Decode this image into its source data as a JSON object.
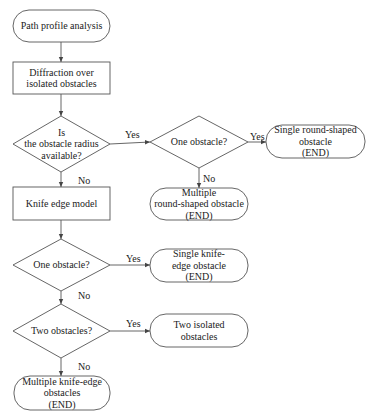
{
  "colors": {
    "stroke": "#555555",
    "text": "#222222",
    "background": "#ffffff"
  },
  "nodes": {
    "start": {
      "lines": [
        "Path profile analysis"
      ],
      "shape": "terminal"
    },
    "diffraction": {
      "lines": [
        "Diffraction over",
        "isolated obstacles"
      ],
      "shape": "process"
    },
    "radius_decision": {
      "lines": [
        "Is",
        "the obstacle radius",
        "available?"
      ],
      "shape": "decision"
    },
    "one_obstacle_round": {
      "lines": [
        "One obstacle?"
      ],
      "shape": "decision"
    },
    "single_round_end": {
      "lines": [
        "Single round-shaped",
        "obstacle",
        "(END)"
      ],
      "shape": "terminal"
    },
    "multiple_round_end": {
      "lines": [
        "Multiple",
        "round-shaped obstacle",
        "(END)"
      ],
      "shape": "terminal"
    },
    "knife_edge_model": {
      "lines": [
        "Knife edge model"
      ],
      "shape": "process"
    },
    "one_obstacle_knife": {
      "lines": [
        "One obstacle?"
      ],
      "shape": "decision"
    },
    "single_knife_end": {
      "lines": [
        "Single knife-",
        "edge obstacle",
        "(END)"
      ],
      "shape": "terminal"
    },
    "two_obstacles": {
      "lines": [
        "Two obstacles?"
      ],
      "shape": "decision"
    },
    "two_isolated": {
      "lines": [
        "Two isolated",
        "obstacles"
      ],
      "shape": "terminal"
    },
    "multiple_knife_end": {
      "lines": [
        "Multiple knife-edge",
        "obstacles",
        "(END)"
      ],
      "shape": "terminal"
    }
  },
  "edge_labels": {
    "radius_yes": "Yes",
    "radius_no": "No",
    "round_one_yes": "Yes",
    "round_one_no": "No",
    "knife_one_yes": "Yes",
    "knife_one_no": "No",
    "two_yes": "Yes",
    "two_no": "No"
  }
}
